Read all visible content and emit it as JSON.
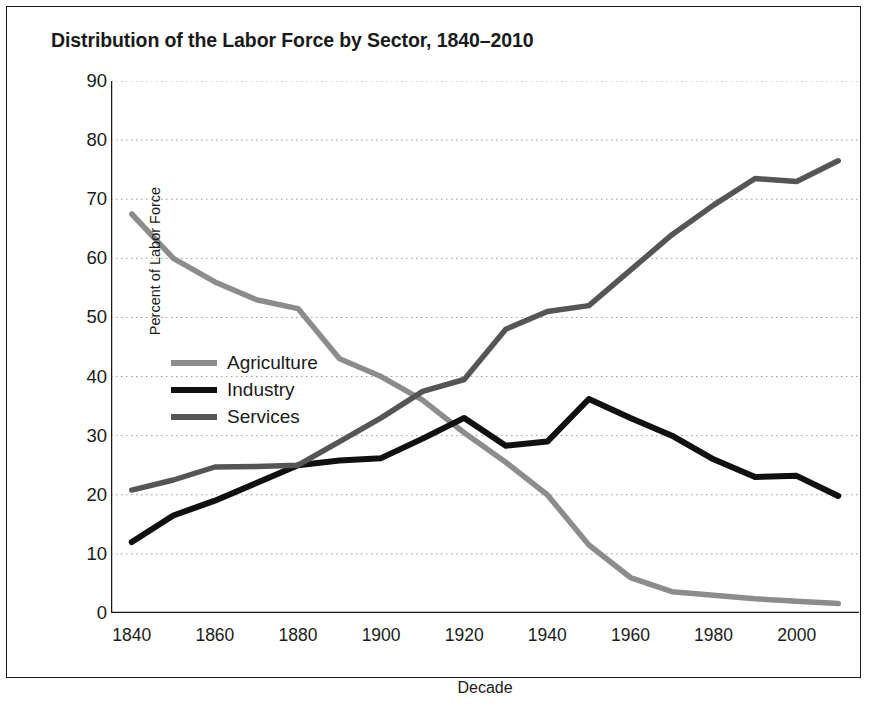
{
  "figure": {
    "title": "Distribution of the Labor Force by Sector, 1840–2010",
    "border_color": "#1a1a1a",
    "background": "#ffffff"
  },
  "legend": {
    "position": "inside-left-middle",
    "entries": [
      {
        "label": "Agriculture",
        "color": "#8c8c8c"
      },
      {
        "label": "Industry",
        "color": "#101010"
      },
      {
        "label": "Services",
        "color": "#555555"
      }
    ]
  },
  "chart_data": {
    "type": "line",
    "title": "Distribution of the Labor Force by Sector, 1840–2010",
    "xlabel": "Decade",
    "ylabel": "Percent of Labor Force",
    "xlim": [
      1835,
      2015
    ],
    "ylim": [
      0,
      90
    ],
    "grid": true,
    "grid_axis": "y",
    "grid_style": "dotted",
    "x_major_ticks": [
      1840,
      1860,
      1880,
      1900,
      1920,
      1940,
      1960,
      1980,
      2000
    ],
    "x_minor_ticks": [
      1850,
      1870,
      1890,
      1910,
      1930,
      1950,
      1970,
      1990,
      2010
    ],
    "x_tick_labels": [
      "1840",
      "1860",
      "1880",
      "1900",
      "1920",
      "1940",
      "1960",
      "1980",
      "2000"
    ],
    "y_ticks": [
      0,
      10,
      20,
      30,
      40,
      50,
      60,
      70,
      80,
      90
    ],
    "y_tick_labels": [
      "0",
      "10",
      "20",
      "30",
      "40",
      "50",
      "60",
      "70",
      "80",
      "90"
    ],
    "x": [
      1840,
      1850,
      1860,
      1870,
      1880,
      1890,
      1900,
      1910,
      1920,
      1930,
      1940,
      1950,
      1960,
      1970,
      1980,
      1990,
      2000,
      2010
    ],
    "series": [
      {
        "name": "Agriculture",
        "color": "#8c8c8c",
        "values": [
          67.5,
          60.0,
          56.0,
          53.0,
          51.5,
          43.0,
          40.0,
          36.0,
          30.5,
          25.5,
          20.0,
          11.5,
          6.0,
          3.6,
          3.0,
          2.4,
          2.0,
          1.6
        ]
      },
      {
        "name": "Industry",
        "color": "#101010",
        "values": [
          12.0,
          16.5,
          19.0,
          22.0,
          25.0,
          25.8,
          26.2,
          29.5,
          33.0,
          28.3,
          29.0,
          36.2,
          33.0,
          30.0,
          26.0,
          23.0,
          23.2,
          19.8
        ]
      },
      {
        "name": "Services",
        "color": "#555555",
        "values": [
          20.8,
          22.5,
          24.7,
          24.8,
          25.0,
          29.0,
          33.0,
          37.5,
          39.5,
          48.0,
          51.0,
          52.0,
          58.0,
          64.0,
          69.0,
          73.5,
          73.0,
          76.5
        ]
      }
    ]
  }
}
